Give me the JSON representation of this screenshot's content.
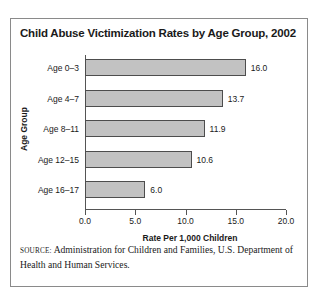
{
  "chart_data": {
    "type": "bar",
    "orientation": "horizontal",
    "title": "Child Abuse Victimization Rates by Age Group, 2002",
    "xlabel": "Rate Per 1,000 Children",
    "ylabel": "Age Group",
    "categories": [
      "Age 0–3",
      "Age 4–7",
      "Age 8–11",
      "Age 12–15",
      "Age 16–17"
    ],
    "values": [
      16.0,
      13.7,
      11.9,
      10.6,
      6.0
    ],
    "value_labels": [
      "16.0",
      "13.7",
      "11.9",
      "10.6",
      "6.0"
    ],
    "xlim": [
      0.0,
      20.0
    ],
    "xticks": [
      0.0,
      5.0,
      10.0,
      15.0,
      20.0
    ],
    "xtick_labels": [
      "0.0",
      "5.0",
      "10.0",
      "15.0",
      "20.0"
    ],
    "grid": false,
    "legend": false,
    "bar_color": "#c2c2c2",
    "bar_edge_color": "#4d4d4d",
    "axis_color": "#555555",
    "text_color": "#1a1a1a"
  },
  "source": {
    "label": "Source:",
    "text": "Administration for Children and Families, U.S. Department of Health and Human Services."
  },
  "frame": {
    "border_color": "#8a8a8a",
    "background": "#ffffff"
  }
}
